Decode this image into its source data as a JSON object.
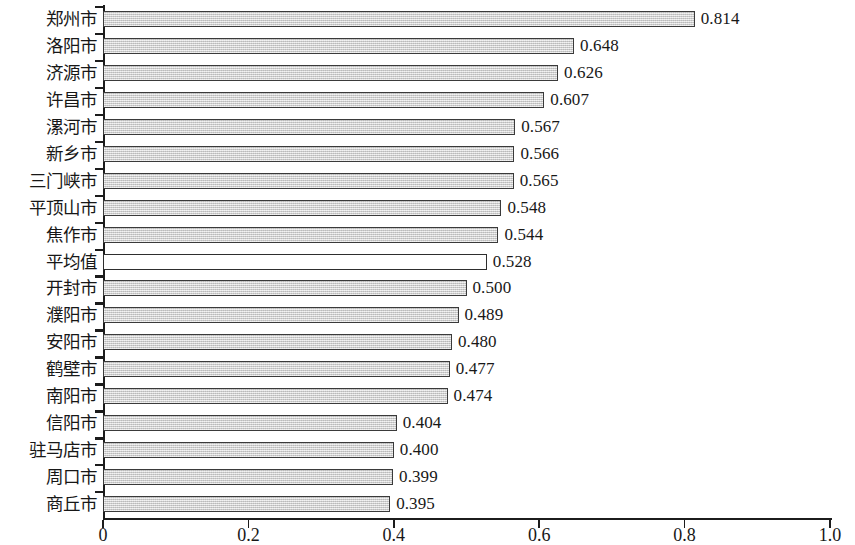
{
  "chart_data": {
    "type": "bar",
    "orientation": "horizontal",
    "title": "",
    "subtitle": "",
    "xlabel": "",
    "ylabel": "",
    "xlim": [
      0,
      1.0
    ],
    "xticks": [
      "0",
      "0.2",
      "0.4",
      "0.6",
      "0.8",
      "1.0"
    ],
    "xtick_values": [
      0,
      0.2,
      0.4,
      0.6,
      0.8,
      1.0
    ],
    "grid": false,
    "legend": false,
    "bar_fill_color": "#d6d6d6",
    "bar_border_color": "#3a3a3a",
    "highlight_fill_color": "#ffffff",
    "categories": [
      "郑州市",
      "洛阳市",
      "济源市",
      "许昌市",
      "漯河市",
      "新乡市",
      "三门峡市",
      "平顶山市",
      "焦作市",
      "平均值",
      "开封市",
      "濮阳市",
      "安阳市",
      "鹤壁市",
      "南阳市",
      "信阳市",
      "驻马店市",
      "周口市",
      "商丘市"
    ],
    "values": [
      0.814,
      0.648,
      0.626,
      0.607,
      0.567,
      0.566,
      0.565,
      0.548,
      0.544,
      0.528,
      0.5,
      0.489,
      0.48,
      0.477,
      0.474,
      0.404,
      0.4,
      0.399,
      0.395
    ],
    "value_labels": [
      "0.814",
      "0.648",
      "0.626",
      "0.607",
      "0.567",
      "0.566",
      "0.565",
      "0.548",
      "0.544",
      "0.528",
      "0.500",
      "0.489",
      "0.480",
      "0.477",
      "0.474",
      "0.404",
      "0.400",
      "0.399",
      "0.395"
    ],
    "hollow_indices": [
      9
    ]
  }
}
